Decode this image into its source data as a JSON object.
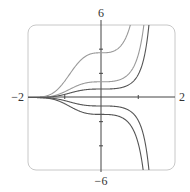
{
  "chart_data": {
    "type": "line",
    "title": "",
    "xlabel": "",
    "ylabel": "",
    "xlim": [
      -2,
      2
    ],
    "ylim": [
      -6,
      6
    ],
    "grid": false,
    "legend": null,
    "x_tick_labels": {
      "left": "−2",
      "right": "2"
    },
    "y_tick_labels": {
      "top": "6",
      "bottom": "−6"
    },
    "x_minor_ticks": [
      -1,
      1
    ],
    "y_minor_ticks": [
      -4,
      -2,
      2,
      4
    ],
    "series": [
      {
        "name": "C=3.7",
        "C": 3.7,
        "color": "#9a9a9a",
        "values_at": {
          "x": [
            -2,
            -1,
            0,
            0.5,
            0.8
          ],
          "y": [
            0.0,
            1.36,
            3.7,
            4.19,
            6.0
          ]
        }
      },
      {
        "name": "C=1.3",
        "C": 1.3,
        "color": "#9a9a9a",
        "values_at": {
          "x": [
            -2,
            -1,
            0,
            1,
            1.45
          ],
          "y": [
            0.0,
            0.48,
            1.3,
            3.53,
            6.0
          ]
        }
      },
      {
        "name": "C=0.7",
        "C": 0.7,
        "color": "#555555",
        "values_at": {
          "x": [
            -2,
            -1,
            0,
            1,
            1.6
          ],
          "y": [
            0.0,
            0.26,
            0.7,
            1.9,
            6.0
          ]
        }
      },
      {
        "name": "C=-0.7",
        "C": -0.7,
        "color": "#555555",
        "values_at": {
          "x": [
            -2,
            -1,
            0,
            1,
            1.6
          ],
          "y": [
            0.0,
            -0.26,
            -0.7,
            -1.9,
            -6.0
          ]
        }
      },
      {
        "name": "C=-1.4",
        "C": -1.4,
        "color": "#555555",
        "values_at": {
          "x": [
            -2,
            -1,
            0,
            1,
            1.43
          ],
          "y": [
            0.0,
            -0.52,
            -1.4,
            -3.8,
            -6.0
          ]
        }
      }
    ]
  },
  "colors": {
    "axis": "#444444",
    "frame": "#c8c8c8",
    "label": "#333333"
  }
}
